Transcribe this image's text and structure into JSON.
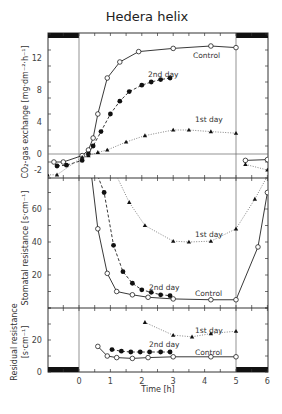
{
  "chart_data": [
    {
      "type": "line",
      "title": "Hedera helix",
      "panel": "top",
      "xlabel": "Time [h]",
      "ylabel": "CO2-gas exchange [mg dm-2 h-1]",
      "ylim": [
        -3,
        15
      ],
      "yticks": [
        -2,
        0,
        4,
        8,
        12
      ],
      "series": [
        {
          "name": "Control",
          "marker": "open-circle",
          "line": "solid",
          "x": [
            -0.8,
            -0.5,
            0.1,
            0.3,
            0.45,
            0.6,
            0.9,
            1.3,
            1.9,
            3.0,
            4.2,
            5.0,
            5.3,
            6.0
          ],
          "y": [
            -1.0,
            -1.0,
            -0.2,
            0.5,
            2.0,
            5.0,
            9.5,
            11.5,
            12.8,
            13.2,
            13.5,
            13.3,
            -0.8,
            -0.7
          ]
        },
        {
          "name": "2nd day",
          "marker": "filled-circle",
          "line": "dashed",
          "x": [
            -0.7,
            -0.4,
            0.1,
            0.3,
            0.45,
            0.7,
            1.0,
            1.3,
            1.6,
            2.0,
            2.3,
            2.6,
            2.9
          ],
          "y": [
            -1.5,
            -1.4,
            -0.8,
            0.0,
            1.0,
            2.8,
            5.0,
            6.6,
            7.8,
            8.6,
            9.0,
            9.3,
            9.5
          ]
        },
        {
          "name": "1st day",
          "marker": "filled-triangle",
          "line": "dotted",
          "x": [
            -1.0,
            -0.7,
            0.1,
            0.3,
            0.6,
            0.9,
            1.5,
            2.1,
            3.0,
            3.5,
            4.2,
            5.0,
            5.3,
            6.0
          ],
          "y": [
            -2.6,
            -2.6,
            -0.4,
            -0.2,
            0.2,
            0.5,
            1.5,
            2.3,
            3.0,
            3.0,
            2.8,
            2.6,
            -1.3,
            -2.0
          ]
        }
      ],
      "annotations": [
        "Control",
        "2nd day",
        "1st day"
      ]
    },
    {
      "type": "line",
      "panel": "middle",
      "ylabel": "Stomatal resistance [s cm-1]",
      "ylim": [
        0,
        80
      ],
      "yticks": [
        20,
        40,
        60
      ],
      "series": [
        {
          "name": "Control",
          "marker": "open-circle",
          "line": "solid",
          "x": [
            0.4,
            0.6,
            0.9,
            1.2,
            1.7,
            2.2,
            3.0,
            4.2,
            5.0,
            5.7,
            6.0
          ],
          "y": [
            80,
            48,
            21,
            10,
            8,
            6.5,
            5.5,
            5,
            5,
            37,
            70
          ]
        },
        {
          "name": "2nd day",
          "marker": "filled-circle",
          "line": "dashed",
          "x": [
            0.6,
            0.8,
            1.1,
            1.4,
            1.7,
            2.0,
            2.3,
            2.6,
            2.9
          ],
          "y": [
            80,
            70,
            38,
            22,
            15,
            11,
            9.5,
            8,
            7.5
          ]
        },
        {
          "name": "1st day",
          "marker": "filled-triangle",
          "line": "dotted",
          "x": [
            1.2,
            1.6,
            2.1,
            3.0,
            3.5,
            4.2,
            5.0,
            5.6,
            6.0
          ],
          "y": [
            80,
            64,
            50,
            40.5,
            40,
            40.5,
            48,
            66,
            80
          ]
        }
      ],
      "annotations": [
        "1st day",
        "2nd day",
        "Control"
      ]
    },
    {
      "type": "line",
      "panel": "bottom",
      "ylabel": "Residual resistance [s cm-1]",
      "ylim": [
        0,
        40
      ],
      "yticks": [
        0,
        20
      ],
      "xlim": [
        -1,
        6
      ],
      "xticks": [
        0,
        1,
        2,
        3,
        4,
        5,
        6
      ],
      "series": [
        {
          "name": "Control",
          "marker": "open-circle",
          "line": "solid",
          "x": [
            0.6,
            0.9,
            1.2,
            1.7,
            2.2,
            3.0,
            4.2,
            5.0
          ],
          "y": [
            16,
            10,
            9,
            8.5,
            9,
            9.5,
            9.5,
            9.5
          ]
        },
        {
          "name": "2nd day",
          "marker": "filled-circle",
          "line": "dashed",
          "x": [
            1.05,
            1.35,
            1.65,
            1.95,
            2.25,
            2.6,
            2.9
          ],
          "y": [
            14,
            13,
            12.5,
            12.5,
            12.5,
            12.5,
            12.5
          ]
        },
        {
          "name": "1st day",
          "marker": "filled-triangle",
          "line": "dotted",
          "x": [
            2.1,
            3.0,
            3.6,
            4.2,
            5.0
          ],
          "y": [
            31,
            23,
            22,
            24,
            25.5
          ]
        }
      ],
      "annotations": [
        "1st day",
        "2nd day",
        "Control"
      ]
    }
  ],
  "labels": {
    "title": "Hedera helix",
    "xlabel": "Time [h]",
    "y_top": "CO₂-gas exchange [mg·dm⁻²·h⁻¹]",
    "y_mid": "Stomatal resistance [s·cm⁻¹]",
    "y_bot1": "Residual resistance",
    "y_bot2": "[s·cm⁻¹]",
    "control": "Control",
    "day1": "1st day",
    "day2": "2nd day"
  }
}
